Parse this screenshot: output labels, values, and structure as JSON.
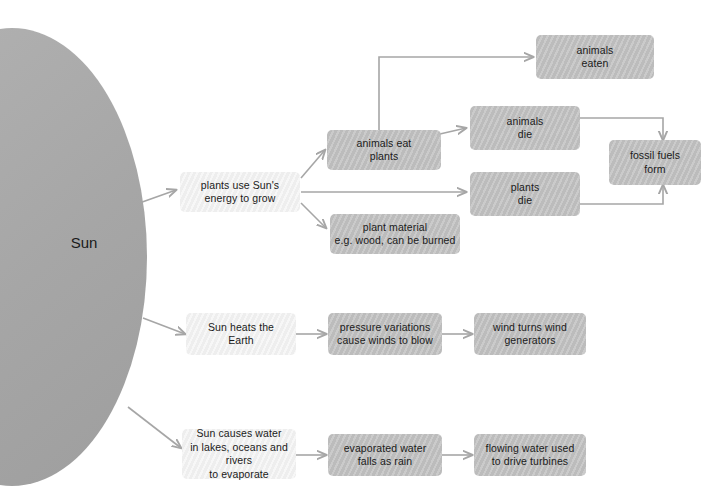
{
  "diagram": {
    "background": "#ffffff",
    "colors": {
      "sun_fill": "#a9a9a9",
      "node_dark": "#bcbcbc",
      "node_light": "#eeeeee",
      "connector": "#a6a6a6",
      "text": "#1a1a1a"
    },
    "sun": {
      "label": "Sun"
    },
    "nodes": [
      {
        "id": "plants-use-suns-energy",
        "label": "plants use Sun's energy to grow",
        "shade": "light"
      },
      {
        "id": "animals-eat-plants",
        "label": "animals eat plants",
        "shade": "dark"
      },
      {
        "id": "plant-material",
        "label": "plant material e.g. wood, can be burned",
        "shade": "dark"
      },
      {
        "id": "animals-eaten",
        "label": "animals eaten",
        "shade": "dark"
      },
      {
        "id": "animals-die",
        "label": "animals die",
        "shade": "dark"
      },
      {
        "id": "plants-die",
        "label": "plants die",
        "shade": "dark"
      },
      {
        "id": "fossil-fuels-form",
        "label": "fossil fuels form",
        "shade": "dark"
      },
      {
        "id": "sun-heats-earth",
        "label": "Sun heats the Earth",
        "shade": "light"
      },
      {
        "id": "pressure-variations",
        "label": "pressure variations cause winds to blow",
        "shade": "dark"
      },
      {
        "id": "wind-turns-generators",
        "label": "wind turns wind generators",
        "shade": "dark"
      },
      {
        "id": "sun-causes-water-evaporate",
        "label": "Sun causes water in lakes, oceans and rivers to evaporate",
        "shade": "light"
      },
      {
        "id": "evaporated-water-rain",
        "label": "evaporated water falls as rain",
        "shade": "dark"
      },
      {
        "id": "flowing-water-turbines",
        "label": "flowing water used to drive turbines",
        "shade": "dark"
      }
    ],
    "node_text": {
      "plants_use_suns_energy_l1": "plants use Sun's",
      "plants_use_suns_energy_l2": "energy to grow",
      "animals_eat_plants_l1": "animals eat",
      "animals_eat_plants_l2": "plants",
      "plant_material_l1": "plant material",
      "plant_material_l2": "e.g. wood, can be burned",
      "animals_eaten_l1": "animals",
      "animals_eaten_l2": "eaten",
      "animals_die_l1": "animals",
      "animals_die_l2": "die",
      "plants_die_l1": "plants",
      "plants_die_l2": "die",
      "fossil_fuels_form_l1": "fossil fuels",
      "fossil_fuels_form_l2": "form",
      "sun_heats_earth_l1": "Sun heats the",
      "sun_heats_earth_l2": "Earth",
      "pressure_variations_l1": "pressure variations",
      "pressure_variations_l2": "cause winds to blow",
      "wind_turns_generators_l1": "wind turns wind",
      "wind_turns_generators_l2": "generators",
      "sun_causes_water_l1": "Sun causes water",
      "sun_causes_water_l2": "in lakes, oceans and rivers",
      "sun_causes_water_l3": "to evaporate",
      "evaporated_water_l1": "evaporated water",
      "evaporated_water_l2": "falls as rain",
      "flowing_water_l1": "flowing water used",
      "flowing_water_l2": "to drive turbines"
    },
    "edges": [
      {
        "id": "sun-to-plants",
        "from": "sun",
        "to": "plants-use-suns-energy"
      },
      {
        "id": "sun-to-heats-earth",
        "from": "sun",
        "to": "sun-heats-earth"
      },
      {
        "id": "sun-to-water",
        "from": "sun",
        "to": "sun-causes-water-evaporate"
      },
      {
        "id": "plants-to-animals-eat",
        "from": "plants-use-suns-energy",
        "to": "animals-eat-plants"
      },
      {
        "id": "plants-to-plant-material",
        "from": "plants-use-suns-energy",
        "to": "plant-material"
      },
      {
        "id": "plants-to-plants-die",
        "from": "plants-use-suns-energy",
        "to": "plants-die"
      },
      {
        "id": "animals-eat-to-animals-eaten",
        "from": "animals-eat-plants",
        "to": "animals-eaten"
      },
      {
        "id": "animals-eat-to-animals-die",
        "from": "animals-eat-plants",
        "to": "animals-die"
      },
      {
        "id": "animals-die-to-fossil-fuels",
        "from": "animals-die",
        "to": "fossil-fuels-form"
      },
      {
        "id": "plants-die-to-fossil-fuels",
        "from": "plants-die",
        "to": "fossil-fuels-form"
      },
      {
        "id": "heats-earth-to-pressure",
        "from": "sun-heats-earth",
        "to": "pressure-variations"
      },
      {
        "id": "pressure-to-wind-generators",
        "from": "pressure-variations",
        "to": "wind-turns-generators"
      },
      {
        "id": "water-to-evaporated",
        "from": "sun-causes-water-evaporate",
        "to": "evaporated-water-rain"
      },
      {
        "id": "evaporated-to-flowing",
        "from": "evaporated-water-rain",
        "to": "flowing-water-turbines"
      }
    ]
  }
}
